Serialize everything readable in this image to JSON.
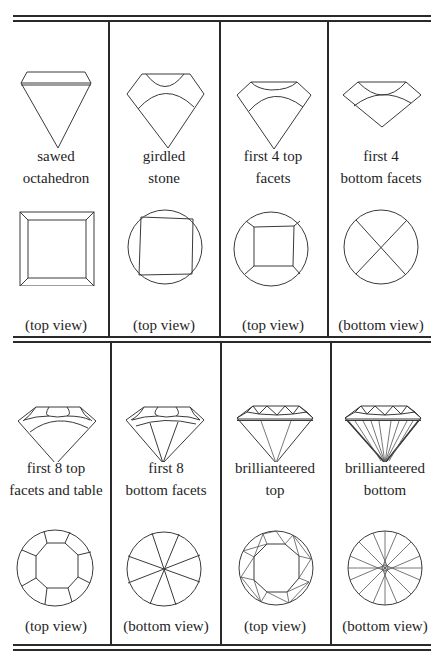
{
  "figure": {
    "rows": [
      {
        "cells": [
          {
            "label_line1": "sawed",
            "label_line2": "octahedron",
            "caption": "(top view)",
            "icon": "sawed-octahedron"
          },
          {
            "label_line1": "girdled",
            "label_line2": "stone",
            "caption": "(top view)",
            "icon": "girdled-stone"
          },
          {
            "label_line1": "first 4 top",
            "label_line2": "facets",
            "caption": "(top view)",
            "icon": "first-4-top-facets"
          },
          {
            "label_line1": "first 4",
            "label_line2": "bottom facets",
            "caption": "(bottom view)",
            "icon": "first-4-bottom-facets"
          }
        ]
      },
      {
        "cells": [
          {
            "label_line1": "first 8 top",
            "label_line2": "facets and table",
            "caption": "(top view)",
            "icon": "first-8-top-facets-and-table"
          },
          {
            "label_line1": "first 8",
            "label_line2": "bottom facets",
            "caption": "(bottom view)",
            "icon": "first-8-bottom-facets"
          },
          {
            "label_line1": "brillianteered",
            "label_line2": "top",
            "caption": "(top view)",
            "icon": "brillianteered-top"
          },
          {
            "label_line1": "brillianteered",
            "label_line2": "bottom",
            "caption": "(bottom view)",
            "icon": "brillianteered-bottom"
          }
        ]
      }
    ],
    "colors": {
      "line": "#2a2a2a",
      "background": "#ffffff",
      "text": "#1e1e1e"
    }
  }
}
